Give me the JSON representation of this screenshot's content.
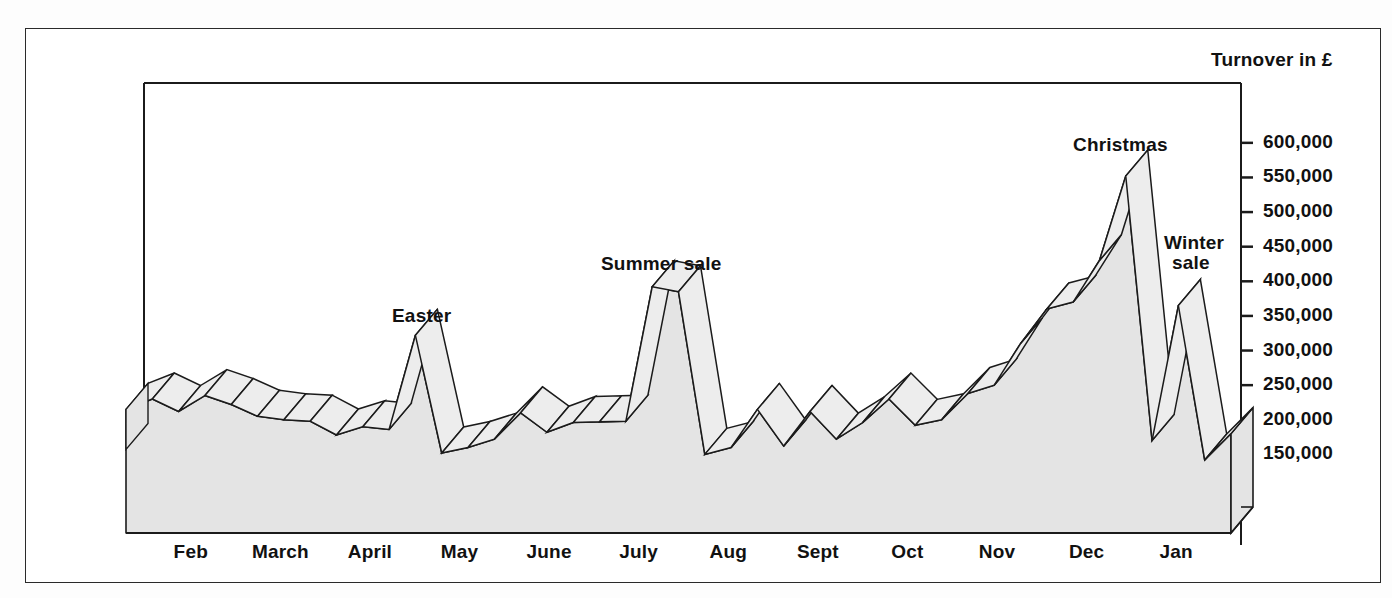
{
  "chart_data": {
    "type": "area",
    "title": "",
    "subtitle": "",
    "ylabel": "Turnover in £",
    "xlabel": "",
    "grid": false,
    "legend": "none",
    "ylim": [
      100000,
      620000
    ],
    "ytick_labels": [
      "600,000",
      "550,000",
      "500,000",
      "450,000",
      "400,000",
      "350,000",
      "300,000",
      "250,000",
      "200,000",
      "150,000"
    ],
    "ytick_values": [
      600000,
      550000,
      500000,
      450000,
      400000,
      350000,
      300000,
      250000,
      200000,
      150000
    ],
    "categories": [
      "Feb",
      "March",
      "April",
      "May",
      "June",
      "July",
      "Aug",
      "Sept",
      "Oct",
      "Nov",
      "Dec",
      "Jan"
    ],
    "x": [
      "Feb",
      "March",
      "April",
      "May",
      "June",
      "July",
      "Aug",
      "Sept",
      "Oct",
      "Nov",
      "Dec",
      "Jan"
    ],
    "series": [
      {
        "name": "Turnover",
        "points": [
          {
            "label": "Feb wk1",
            "value": 215000
          },
          {
            "label": "Feb wk2",
            "value": 230000
          },
          {
            "label": "Feb wk3",
            "value": 212000
          },
          {
            "label": "March wk1",
            "value": 235000
          },
          {
            "label": "March wk2",
            "value": 222000
          },
          {
            "label": "March wk3",
            "value": 205000
          },
          {
            "label": "March wk4",
            "value": 200000
          },
          {
            "label": "April wk1",
            "value": 198000
          },
          {
            "label": "April wk2",
            "value": 178000
          },
          {
            "label": "April wk3",
            "value": 190000
          },
          {
            "label": "April wk4",
            "value": 186000
          },
          {
            "label": "Easter",
            "value": 322000
          },
          {
            "label": "May wk1",
            "value": 152000
          },
          {
            "label": "May wk2",
            "value": 160000
          },
          {
            "label": "May wk3",
            "value": 172000
          },
          {
            "label": "June wk1",
            "value": 210000
          },
          {
            "label": "June wk2",
            "value": 182000
          },
          {
            "label": "June wk3",
            "value": 196000
          },
          {
            "label": "June wk4",
            "value": 197000
          },
          {
            "label": "July wk1",
            "value": 198000
          },
          {
            "label": "Summer sale",
            "value": 392000
          },
          {
            "label": "July wk3",
            "value": 385000
          },
          {
            "label": "July wk4",
            "value": 150000
          },
          {
            "label": "Aug wk1",
            "value": 160000
          },
          {
            "label": "Aug wk2",
            "value": 215000
          },
          {
            "label": "Aug wk3",
            "value": 162000
          },
          {
            "label": "Sept wk1",
            "value": 212000
          },
          {
            "label": "Sept wk2",
            "value": 172000
          },
          {
            "label": "Sept wk3",
            "value": 196000
          },
          {
            "label": "Oct wk1",
            "value": 230000
          },
          {
            "label": "Oct wk2",
            "value": 192000
          },
          {
            "label": "Oct wk3",
            "value": 200000
          },
          {
            "label": "Oct wk4",
            "value": 238000
          },
          {
            "label": "Nov wk1",
            "value": 250000
          },
          {
            "label": "Nov wk2",
            "value": 310000
          },
          {
            "label": "Nov wk3",
            "value": 360000
          },
          {
            "label": "Nov wk4",
            "value": 370000
          },
          {
            "label": "Dec wk1",
            "value": 430000
          },
          {
            "label": "Christmas",
            "value": 552000
          },
          {
            "label": "Dec wk4",
            "value": 170000
          },
          {
            "label": "Winter sale",
            "value": 365000
          },
          {
            "label": "Jan wk3",
            "value": 142000
          },
          {
            "label": "Jan wk4",
            "value": 180000
          }
        ]
      }
    ],
    "annotations": [
      {
        "name": "easter",
        "text": "Easter",
        "lines": [
          "Easter"
        ]
      },
      {
        "name": "summer-sale",
        "text": "Summer sale",
        "lines": [
          "Summer sale"
        ]
      },
      {
        "name": "christmas",
        "text": "Christmas",
        "lines": [
          "Christmas"
        ]
      },
      {
        "name": "winter-sale",
        "text": "Winter sale",
        "lines": [
          "Winter",
          "sale"
        ]
      }
    ],
    "colors": {
      "ribbon_front": "#e4e4e4",
      "ribbon_top": "#ededed",
      "outline": "#1b1b1b",
      "axis": "#1b1b1b",
      "background": "#ffffff"
    }
  },
  "axis": {
    "y_title": "Turnover in £",
    "ticks": [
      "600,000",
      "550,000",
      "500,000",
      "450,000",
      "400,000",
      "350,000",
      "300,000",
      "250,000",
      "200,000",
      "150,000"
    ],
    "months": [
      "Feb",
      "March",
      "April",
      "May",
      "June",
      "July",
      "Aug",
      "Sept",
      "Oct",
      "Nov",
      "Dec",
      "Jan"
    ]
  },
  "annotations": {
    "easter": "Easter",
    "summer_sale": "Summer sale",
    "christmas": "Christmas",
    "winter_sale_1": "Winter",
    "winter_sale_2": "sale"
  }
}
